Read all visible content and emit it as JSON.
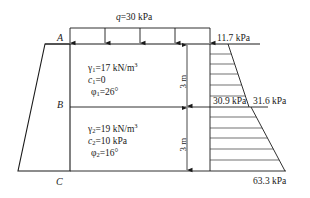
{
  "figure": {
    "surcharge": {
      "symbol": "q",
      "label": "q=30 kPa",
      "value": 30,
      "unit": "kPa",
      "arrow_count": 5
    },
    "points": {
      "A": "A",
      "B": "B",
      "C": "C"
    },
    "layers": [
      {
        "name": "layer-1",
        "gamma_label": "γ",
        "gamma_sub": "1",
        "gamma_value": "=17 kN/m",
        "gamma_sup": "3",
        "c_label": "c",
        "c_sub": "1",
        "c_value": "=0",
        "phi_label": "φ",
        "phi_sub": "1",
        "phi_value": "=26°",
        "thickness_label": "3 m"
      },
      {
        "name": "layer-2",
        "gamma_label": "γ",
        "gamma_sub": "2",
        "gamma_value": "=19 kN/m",
        "gamma_sup": "3",
        "c_label": "c",
        "c_sub": "2",
        "c_value": "=10 kPa",
        "phi_label": "φ",
        "phi_sub": "2",
        "phi_value": "=16°",
        "thickness_label": "3 m"
      }
    ],
    "pressures": {
      "top": "11.7 kPa",
      "b_upper": "30.9 kPa",
      "b_lower": "31.6 kPa",
      "bottom": "63.3 kPa"
    },
    "colors": {
      "line": "#1a1a1a",
      "hatch": "#333333",
      "background": "#ffffff"
    }
  }
}
